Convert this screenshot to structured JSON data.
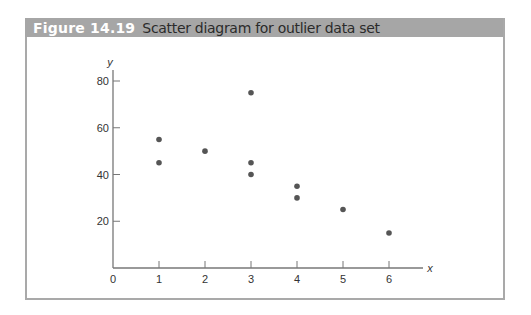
{
  "figure": {
    "label": "Figure 14.19",
    "caption": "Scatter diagram for outlier data set"
  },
  "colors": {
    "header_bg": "#a6a6a6",
    "frame": "#a9a9a9",
    "axis": "#777777",
    "point": "#555555"
  },
  "chart_data": {
    "type": "scatter",
    "title": "Scatter diagram for outlier data set",
    "xlabel": "x",
    "ylabel": "y",
    "xlim": [
      0,
      6.7
    ],
    "ylim": [
      0,
      85
    ],
    "xticks": [
      0,
      1,
      2,
      3,
      4,
      5,
      6
    ],
    "yticks": [
      20,
      40,
      60,
      80
    ],
    "grid": false,
    "legend": null,
    "series": [
      {
        "name": "outlier data set",
        "points": [
          {
            "x": 1,
            "y": 55
          },
          {
            "x": 1,
            "y": 45
          },
          {
            "x": 2,
            "y": 50
          },
          {
            "x": 3,
            "y": 75
          },
          {
            "x": 3,
            "y": 45
          },
          {
            "x": 3,
            "y": 40
          },
          {
            "x": 4,
            "y": 35
          },
          {
            "x": 4,
            "y": 30
          },
          {
            "x": 5,
            "y": 25
          },
          {
            "x": 6,
            "y": 15
          }
        ]
      }
    ]
  }
}
